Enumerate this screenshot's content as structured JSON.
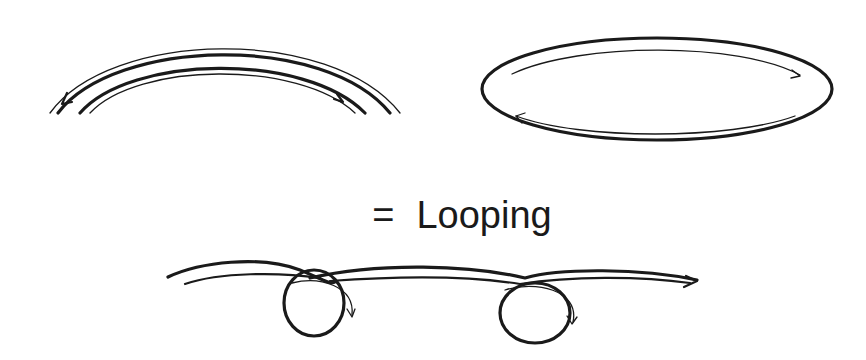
{
  "diagram": {
    "label": {
      "equals": "=",
      "text": "Looping"
    },
    "figures": [
      {
        "name": "arc",
        "description": "parallel arched strokes with bidirectional arrows"
      },
      {
        "name": "ellipse",
        "description": "closed ellipse with clockwise circulating arrows"
      },
      {
        "name": "looped-line",
        "description": "wavy line with two loops and directional arrows"
      }
    ],
    "colors": {
      "ink": "#1a1a1a",
      "background": "#ffffff"
    }
  }
}
